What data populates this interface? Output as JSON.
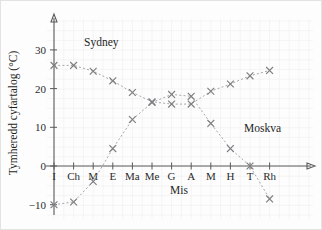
{
  "chart_data": {
    "type": "line",
    "title": "",
    "subtitle": "",
    "xlabel": "Mis",
    "ylabel": "Tymheredd cyfartalog (°C)",
    "categories": [
      "I",
      "Ch",
      "M",
      "E",
      "Ma",
      "Me",
      "G",
      "A",
      "M",
      "H",
      "T",
      "Rh"
    ],
    "ylim": [
      -12,
      32
    ],
    "xlim": [
      0,
      13
    ],
    "yticks": [
      -10,
      0,
      10,
      20,
      30
    ],
    "ytick_labels": [
      "−10",
      "0",
      "10",
      "20",
      "30"
    ],
    "grid": true,
    "grid_style": "faint square grid",
    "legend": "inline data labels",
    "marker": "x",
    "line_style": "dotted",
    "series": [
      {
        "name": "Sydney",
        "label_position": "upper-left",
        "values": [
          26.0,
          26.0,
          24.5,
          22.0,
          19.0,
          16.6,
          16.0,
          16.0,
          19.3,
          21.2,
          23.3,
          24.7
        ]
      },
      {
        "name": "Moskva",
        "label_position": "right",
        "values": [
          -10.0,
          -9.3,
          -4.0,
          4.5,
          12.0,
          16.4,
          18.5,
          18.0,
          11.0,
          4.5,
          0.0,
          -8.5
        ]
      }
    ],
    "colors": {
      "axis": "#5b5b5b",
      "series_line": "#9c9c9c",
      "marker": "#7d7d82",
      "text": "#1f1f1f",
      "grid": "#f0f0f0",
      "background": "#fdfdfd",
      "border": "#e3e3e3"
    }
  }
}
